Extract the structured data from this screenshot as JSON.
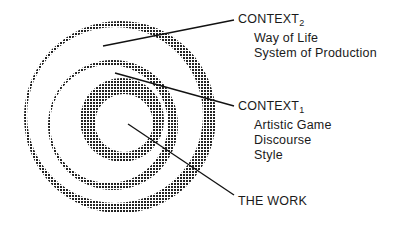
{
  "diagram": {
    "type": "concentric-context-diagram",
    "fill_color": "#2a2a2a",
    "labels": {
      "context2": {
        "title": "CONTEXT",
        "subscript": "2",
        "items": [
          "Way of Life",
          "System of Production"
        ]
      },
      "context1": {
        "title": "CONTEXT",
        "subscript": "1",
        "items": [
          "Artistic Game",
          "Discourse",
          "Style"
        ]
      },
      "work": {
        "title": "THE WORK"
      }
    }
  }
}
